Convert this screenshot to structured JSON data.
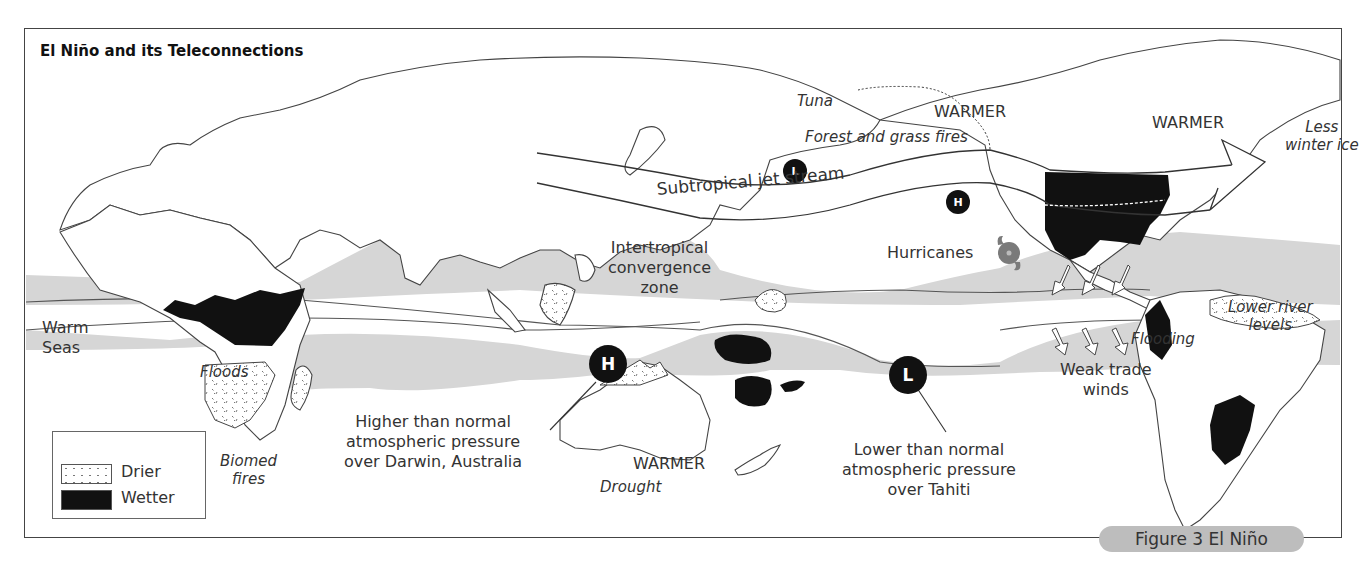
{
  "title": "El Niño and its Teleconnections",
  "figure_caption": "Figure 3 El Niño",
  "legend": {
    "items": [
      {
        "label": "Drier",
        "pattern": "dotted"
      },
      {
        "label": "Wetter",
        "pattern": "solid-black"
      }
    ]
  },
  "colors": {
    "ocean_band": "#d6d6d6",
    "wetter": "#111111",
    "outline": "#444444",
    "hurricane": "#7a7a7a",
    "caption_bg": "#bdbdbd"
  },
  "labels": {
    "warm_seas": [
      "Warm",
      "Seas"
    ],
    "floods": "Floods",
    "biomed_fires": [
      "Biomed",
      "fires"
    ],
    "itcz": [
      "Intertropical",
      "convergence",
      "zone"
    ],
    "jet_stream": "Subtropical jet stream",
    "tuna": "Tuna",
    "warmer_north_pacific": "WARMER",
    "forest_fires": "Forest and grass fires",
    "warmer_canada": "WARMER",
    "less_winter_ice": [
      "Less",
      "winter ice"
    ],
    "hurricanes": "Hurricanes",
    "lower_river_levels": [
      "Lower river",
      "levels"
    ],
    "flooding": "Flooding",
    "weak_trade_winds": [
      "Weak trade",
      "winds"
    ],
    "darwin_note": [
      "Higher than normal",
      "atmospheric pressure",
      "over Darwin, Australia"
    ],
    "warmer_australia": "WARMER",
    "drought": "Drought",
    "tahiti_note": [
      "Lower than normal",
      "atmospheric pressure",
      "over Tahiti"
    ]
  },
  "pressure_markers": [
    {
      "id": "darwin-high",
      "letter": "H",
      "size": "large"
    },
    {
      "id": "tahiti-low",
      "letter": "L",
      "size": "large"
    },
    {
      "id": "north-pacific-low",
      "letter": "L",
      "size": "small"
    },
    {
      "id": "north-pacific-high",
      "letter": "H",
      "size": "small"
    }
  ],
  "icons": [
    "hurricane-icon",
    "trade-wind-arrow-icon",
    "jet-stream-arrow-icon"
  ]
}
